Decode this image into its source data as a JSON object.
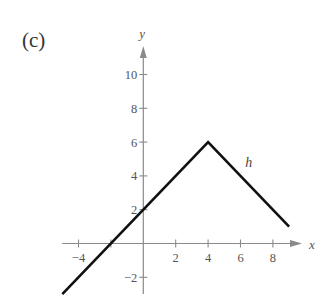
{
  "panel_label": "(c)",
  "chart_data": {
    "type": "line",
    "title": "",
    "panel": "(c)",
    "xlabel": "x",
    "ylabel": "y",
    "series": [
      {
        "name": "h",
        "points": [
          [
            -5,
            -3
          ],
          [
            4,
            6
          ],
          [
            9,
            1
          ]
        ]
      }
    ],
    "x_ticks": [
      -4,
      2,
      4,
      6,
      8
    ],
    "x_tick_marks": [
      -4,
      -2,
      2,
      4,
      6,
      8
    ],
    "y_ticks": [
      -2,
      2,
      4,
      6,
      8,
      10
    ],
    "xlim": [
      -5,
      9.5
    ],
    "ylim": [
      -3,
      11
    ],
    "grid": false,
    "legend": "none",
    "annotations": [
      {
        "text": "h",
        "x": 6.3,
        "y": 4.5
      }
    ]
  },
  "colors": {
    "axis": "#8a8a8a",
    "curve": "#111111",
    "text": "#555555"
  }
}
